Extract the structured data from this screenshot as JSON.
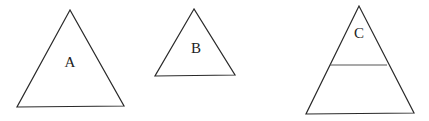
{
  "diagram": {
    "triangles": [
      {
        "id": "A",
        "label": "A",
        "points": [
          [
            70,
            10
          ],
          [
            17,
            107
          ],
          [
            124,
            106
          ]
        ],
        "label_pos": [
          70,
          67
        ],
        "divider": null
      },
      {
        "id": "B",
        "label": "B",
        "points": [
          [
            194,
            9
          ],
          [
            155,
            76
          ],
          [
            235,
            75
          ]
        ],
        "label_pos": [
          196,
          53
        ],
        "divider": null
      },
      {
        "id": "C",
        "label": "C",
        "points": [
          [
            359,
            6
          ],
          [
            306,
            114
          ],
          [
            414,
            113
          ]
        ],
        "label_pos": [
          359,
          38
        ],
        "divider": [
          [
            330,
            65
          ],
          [
            387,
            65
          ]
        ]
      }
    ],
    "colors": {
      "stroke": "#2a2a2a",
      "divider": "#555555",
      "text": "#222222",
      "background": "#ffffff"
    }
  }
}
